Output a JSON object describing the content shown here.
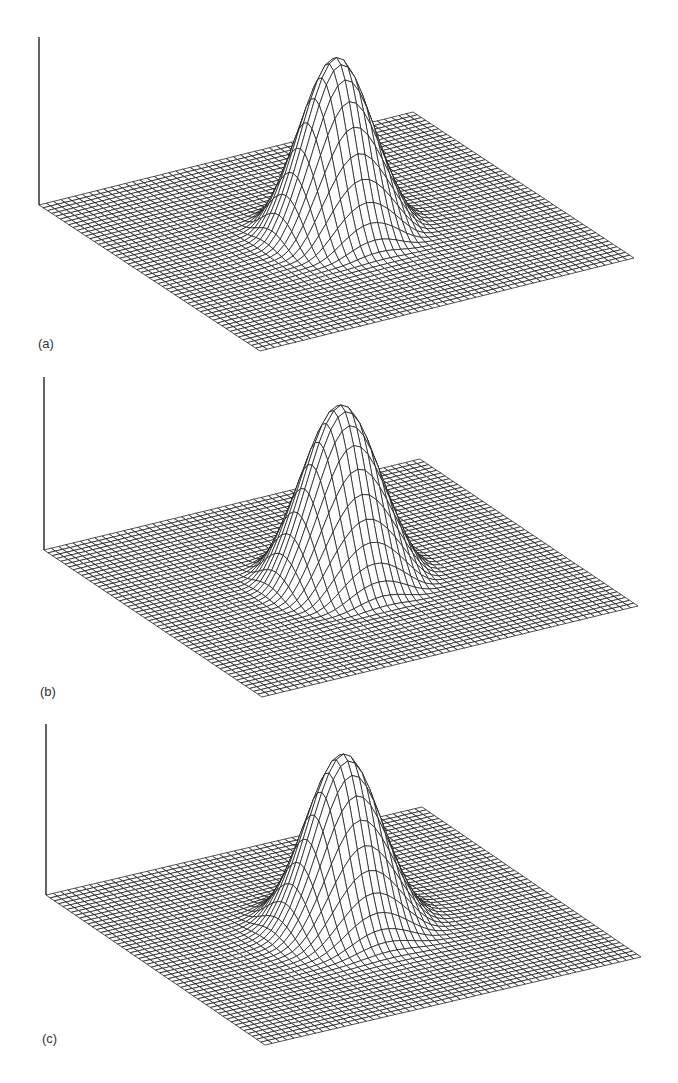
{
  "figure": {
    "panel_count": 3,
    "colors": {
      "mesh_stroke": "#1a1a1a",
      "mesh_fill": "#ffffff",
      "axis": "#222222",
      "label": "#333333",
      "background": "#ffffff"
    }
  },
  "chart_data": [
    {
      "type": "surface-wireframe",
      "label": "(a)",
      "title": "",
      "xlabel": "",
      "ylabel": "",
      "zlabel": "",
      "grid": true,
      "grid_resolution": 52,
      "surface": {
        "shape": "centered peak with ring",
        "peak_width": 0.085,
        "ring_radius": 0.19,
        "ring_width": 0.045,
        "ring_depth": 0.035,
        "peak_height_px": 174
      },
      "layout": {
        "axis": {
          "x": 39,
          "y_top": 37,
          "y_bottom": 205
        },
        "corners": {
          "left": [
            39,
            205
          ],
          "top": [
            413,
            112
          ],
          "right": [
            630,
            257
          ],
          "bottom": [
            260,
            351
          ]
        },
        "label_pos": [
          38,
          336
        ]
      }
    },
    {
      "type": "surface-wireframe",
      "label": "(b)",
      "title": "",
      "xlabel": "",
      "ylabel": "",
      "zlabel": "",
      "grid": true,
      "grid_resolution": 52,
      "surface": {
        "shape": "centered peak with ripple",
        "peak_width": 0.09,
        "ring_radius": 0.2,
        "ring_width": 0.05,
        "ring_depth": 0.045,
        "peak_height_px": 173
      },
      "layout": {
        "axis": {
          "x": 44,
          "y_top": 377,
          "y_bottom": 550
        },
        "corners": {
          "left": [
            44,
            550
          ],
          "top": [
            420,
            459
          ],
          "right": [
            640,
            607
          ],
          "bottom": [
            262,
            697
          ]
        },
        "label_pos": [
          40,
          684
        ]
      }
    },
    {
      "type": "surface-wireframe",
      "label": "(c)",
      "title": "",
      "xlabel": "",
      "ylabel": "",
      "zlabel": "",
      "grid": true,
      "grid_resolution": 52,
      "surface": {
        "shape": "centered peak, smooth skirt",
        "peak_width": 0.088,
        "ring_radius": 0.2,
        "ring_width": 0.05,
        "ring_depth": 0.02,
        "peak_height_px": 172
      },
      "layout": {
        "axis": {
          "x": 46,
          "y_top": 724,
          "y_bottom": 895
        },
        "corners": {
          "left": [
            46,
            895
          ],
          "top": [
            422,
            807
          ],
          "right": [
            635,
            954
          ],
          "bottom": [
            265,
            1045
          ]
        },
        "label_pos": [
          42,
          1031
        ]
      }
    }
  ]
}
